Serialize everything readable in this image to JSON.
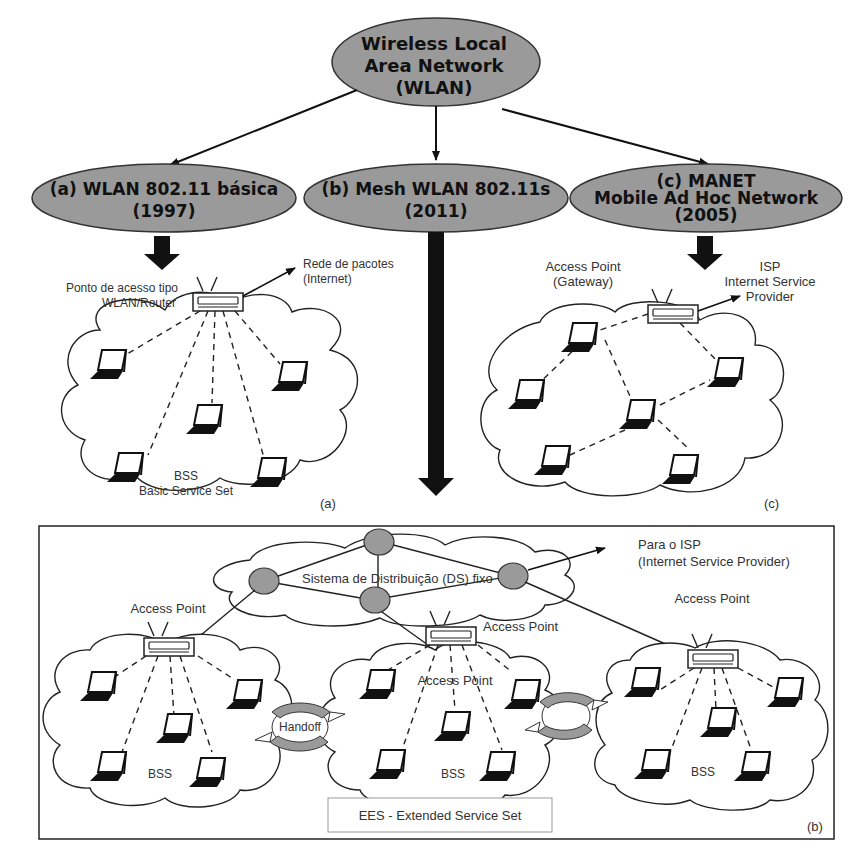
{
  "root": {
    "title_lines": [
      "Wireless Local",
      "Area Network",
      "(WLAN)"
    ]
  },
  "branches": [
    {
      "id": "a",
      "title_lines": [
        "(a)  WLAN 802.11 básica",
        "(1997)"
      ]
    },
    {
      "id": "b",
      "title_lines": [
        "(b) Mesh WLAN 802.11s",
        "(2011)"
      ]
    },
    {
      "id": "c",
      "title_lines": [
        "(c) MANET",
        "Mobile Ad Hoc Network",
        "(2005)"
      ]
    }
  ],
  "panel_a": {
    "ap_label_lines": [
      "Ponto de acesso tipo",
      "WLAN/Router"
    ],
    "uplink_label_lines": [
      "Rede de pacotes",
      "(Internet)"
    ],
    "bss_label_lines": [
      "BSS",
      "Basic Service Set"
    ],
    "tag": "(a)",
    "laptop_count": 5
  },
  "panel_c": {
    "ap_label_lines": [
      "Access Point",
      "(Gateway)"
    ],
    "uplink_label_lines": [
      "ISP",
      "Internet Service",
      "Provider"
    ],
    "tag": "(c)",
    "laptop_count": 6
  },
  "panel_b": {
    "ds_label": "Sistema de Distribuição (DS) fixo",
    "uplink_label_lines": [
      "Para o ISP",
      "(Internet Service Provider)"
    ],
    "ap_labels": [
      "Access Point",
      "Access Point",
      "Access Point",
      "Access Point"
    ],
    "bss_labels": [
      "BSS",
      "BSS",
      "BSS"
    ],
    "handoff_label": "Handoff",
    "ess_label": "EES - Extended Service Set",
    "tag": "(b)"
  },
  "colors": {
    "ellipse_fill": "#9a9a9a",
    "line": "#222222",
    "background": "#ffffff"
  }
}
